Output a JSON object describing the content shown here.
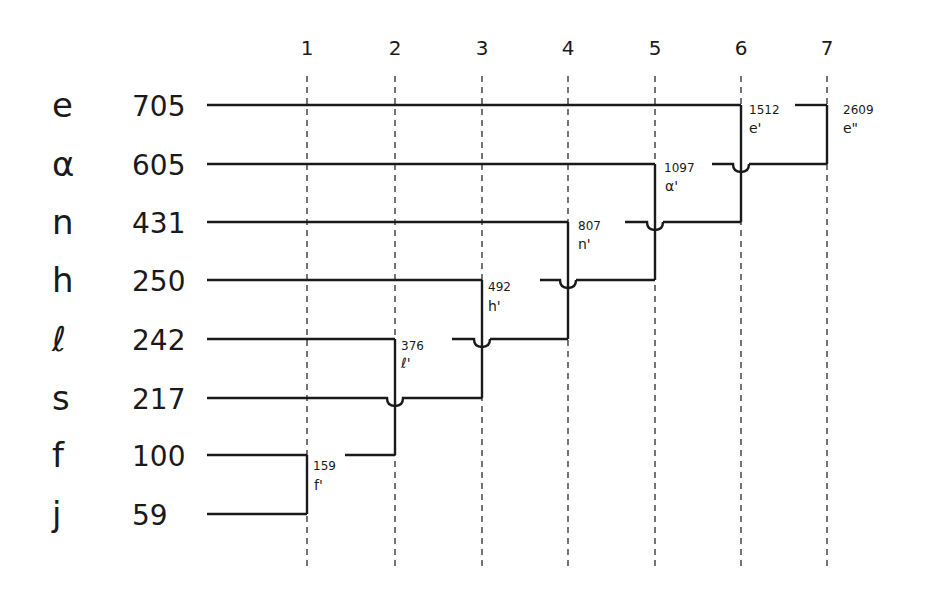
{
  "diagram": {
    "type": "huffman-merge-tree",
    "columns": [
      "1",
      "2",
      "3",
      "4",
      "5",
      "6",
      "7"
    ],
    "symbols": [
      {
        "symbol": "e",
        "frequency": "705"
      },
      {
        "symbol": "α",
        "frequency": "605"
      },
      {
        "symbol": "n",
        "frequency": "431"
      },
      {
        "symbol": "h",
        "frequency": "250"
      },
      {
        "symbol": "ℓ",
        "frequency": "242"
      },
      {
        "symbol": "s",
        "frequency": "217"
      },
      {
        "symbol": "f",
        "frequency": "100"
      },
      {
        "symbol": "j",
        "frequency": "59"
      }
    ],
    "merges": [
      {
        "step": "1",
        "value": "159",
        "label": "f'",
        "children": [
          "f",
          "j"
        ]
      },
      {
        "step": "2",
        "value": "376",
        "label": "ℓ'",
        "children": [
          "ℓ",
          "f'"
        ]
      },
      {
        "step": "3",
        "value": "492",
        "label": "h'",
        "children": [
          "h",
          "s"
        ]
      },
      {
        "step": "4",
        "value": "807",
        "label": "n'",
        "children": [
          "n",
          "ℓ'"
        ]
      },
      {
        "step": "5",
        "value": "1097",
        "label": "α'",
        "children": [
          "α",
          "h'"
        ]
      },
      {
        "step": "6",
        "value": "1512",
        "label": "e'",
        "children": [
          "e",
          "n'"
        ]
      },
      {
        "step": "7",
        "value": "2609",
        "label": "e\"",
        "children": [
          "e'",
          "α'"
        ]
      }
    ]
  }
}
